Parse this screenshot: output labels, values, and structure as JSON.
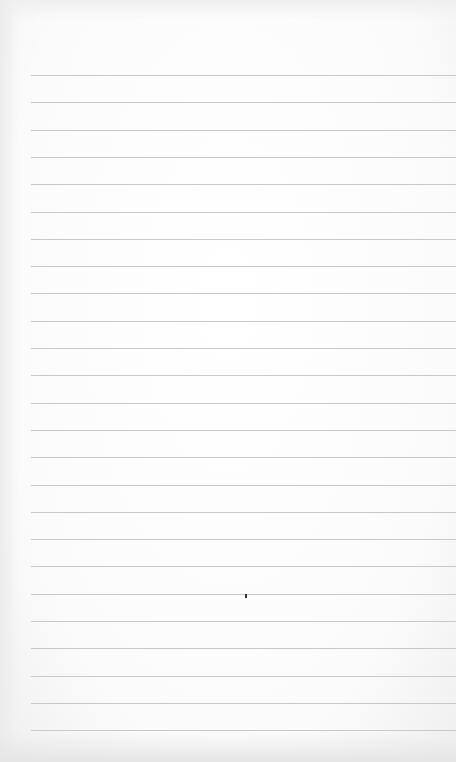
{
  "paper": {
    "type": "lined-paper",
    "line_count": 25,
    "line_start_y": 75,
    "line_spacing": 27.3,
    "line_left_x": 31,
    "line_color": "#c9c9c9",
    "background_color": "#fdfdfd"
  },
  "marks": [
    {
      "x": 245,
      "y": 594
    }
  ]
}
